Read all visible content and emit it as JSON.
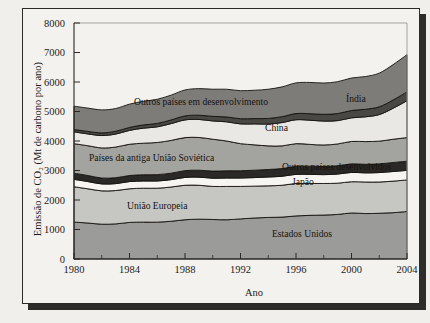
{
  "figure": {
    "background": "#f4f2ee",
    "frame_color": "#2c2a28",
    "shadow_color": "#2e2c2a"
  },
  "axes": {
    "x_title": "Ano",
    "y_title": "Emissão de CO₂ (Mt de carbono por ano)",
    "x_ticks": [
      "1980",
      "1984",
      "1988",
      "1992",
      "1996",
      "2000",
      "2004"
    ],
    "y_ticks": [
      "0",
      "1000",
      "2000",
      "3000",
      "4000",
      "5000",
      "6000",
      "7000",
      "8000"
    ]
  },
  "chart_data": {
    "type": "area",
    "title": "",
    "xlabel": "Ano",
    "ylabel": "Emissão de CO₂ (Mt de carbono por ano)",
    "stacked": true,
    "xlim": [
      1980,
      2004
    ],
    "ylim": [
      0,
      8000
    ],
    "grid": false,
    "legend_position": "inline-labels",
    "x": [
      1980,
      1981,
      1982,
      1983,
      1984,
      1985,
      1986,
      1987,
      1988,
      1989,
      1990,
      1991,
      1992,
      1993,
      1994,
      1995,
      1996,
      1997,
      1998,
      1999,
      2000,
      2001,
      2002,
      2003,
      2004
    ],
    "series": [
      {
        "name": "Estados Unidos",
        "label": "Estados Unidos",
        "color": "#9b9b99",
        "values": [
          1250,
          1220,
          1180,
          1190,
          1240,
          1250,
          1250,
          1280,
          1330,
          1350,
          1340,
          1330,
          1360,
          1390,
          1410,
          1420,
          1460,
          1480,
          1490,
          1510,
          1560,
          1540,
          1550,
          1570,
          1610
        ]
      },
      {
        "name": "União Europeia",
        "label": "União Europeia",
        "color": "#c6c6c3",
        "values": [
          1200,
          1160,
          1130,
          1130,
          1140,
          1150,
          1150,
          1160,
          1170,
          1150,
          1120,
          1130,
          1100,
          1080,
          1070,
          1080,
          1100,
          1080,
          1070,
          1060,
          1060,
          1070,
          1060,
          1070,
          1070
        ]
      },
      {
        "name": "Japão",
        "label": "Japão",
        "color": "#f6f5f2",
        "values": [
          250,
          245,
          235,
          235,
          245,
          245,
          245,
          250,
          265,
          275,
          280,
          285,
          285,
          290,
          300,
          305,
          310,
          310,
          300,
          310,
          315,
          310,
          320,
          325,
          325
        ]
      },
      {
        "name": "Outros países desenvolvidos",
        "label": "Outros países desenvolvidos",
        "color": "#2b2927",
        "values": [
          210,
          205,
          200,
          200,
          205,
          210,
          215,
          220,
          230,
          235,
          240,
          245,
          245,
          250,
          255,
          260,
          270,
          275,
          275,
          280,
          290,
          290,
          295,
          305,
          310
        ]
      },
      {
        "name": "Países da antiga União Soviética",
        "label": "Países da antiga União Soviética",
        "color": "#a3a3a0",
        "values": [
          1000,
          1010,
          1020,
          1040,
          1060,
          1070,
          1090,
          1110,
          1120,
          1110,
          1080,
          1010,
          920,
          860,
          800,
          770,
          770,
          740,
          730,
          740,
          760,
          770,
          770,
          790,
          800
        ]
      },
      {
        "name": "China",
        "label": "China",
        "color": "#e9e8e4",
        "values": [
          400,
          400,
          420,
          440,
          470,
          510,
          530,
          570,
          600,
          610,
          620,
          650,
          670,
          710,
          740,
          790,
          810,
          820,
          810,
          790,
          800,
          840,
          900,
          1050,
          1250
        ]
      },
      {
        "name": "Índia",
        "label": "Índia",
        "color": "#4a4845",
        "values": [
          80,
          85,
          90,
          95,
          100,
          110,
          115,
          125,
          135,
          145,
          155,
          165,
          175,
          180,
          190,
          200,
          210,
          220,
          230,
          240,
          250,
          255,
          265,
          280,
          300
        ]
      },
      {
        "name": "Outros países em desenvolvimento",
        "label": "Outros países em desenvolvimento",
        "color": "#7d7c79",
        "values": [
          790,
          790,
          780,
          770,
          790,
          800,
          820,
          840,
          880,
          900,
          920,
          940,
          950,
          960,
          990,
          1010,
          1040,
          1060,
          1060,
          1080,
          1100,
          1110,
          1140,
          1200,
          1260
        ]
      }
    ],
    "band_labels": [
      {
        "text": "Outros países em desenvolvimento",
        "x": 133,
        "y": 104
      },
      {
        "text": "Índia",
        "x": 345,
        "y": 101
      },
      {
        "text": "China",
        "x": 264,
        "y": 130
      },
      {
        "text": "Países da antiga União Soviética",
        "x": 88,
        "y": 160
      },
      {
        "text": "Outros países desenvolvidos",
        "x": 281,
        "y": 169
      },
      {
        "text": "Japão",
        "x": 291,
        "y": 184
      },
      {
        "text": "União Europeia",
        "x": 126,
        "y": 208
      },
      {
        "text": "Estados Unidos",
        "x": 271,
        "y": 236
      }
    ]
  }
}
